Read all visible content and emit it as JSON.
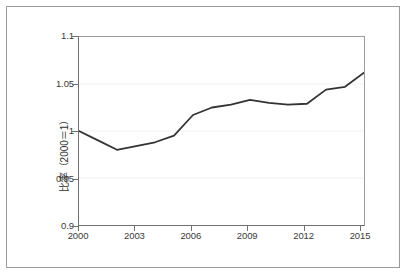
{
  "chart_data": {
    "type": "line",
    "title": "",
    "xlabel": "",
    "ylabel": "比率（2000＝1）",
    "xlim": [
      2000,
      2015
    ],
    "ylim": [
      0.9,
      1.1
    ],
    "grid": true,
    "legend": false,
    "xticks": [
      "2000",
      "2003",
      "2006",
      "2009",
      "2012",
      "2015"
    ],
    "xtick_values": [
      2000,
      2003,
      2006,
      2009,
      2012,
      2015
    ],
    "yticks": [
      "0.9",
      "0.95",
      "1",
      "1.05",
      "1.1"
    ],
    "ytick_values": [
      0.9,
      0.95,
      1.0,
      1.05,
      1.1
    ],
    "x": [
      2000,
      2001,
      2002,
      2003,
      2004,
      2005,
      2006,
      2007,
      2008,
      2009,
      2010,
      2011,
      2012,
      2013,
      2014,
      2015
    ],
    "series": [
      {
        "name": "比率（2000＝1）",
        "color": "#333333",
        "values": [
          1.0,
          0.99,
          0.98,
          0.984,
          0.988,
          0.995,
          1.017,
          1.025,
          1.028,
          1.033,
          1.03,
          1.028,
          1.029,
          1.044,
          1.047,
          1.062
        ]
      }
    ]
  },
  "axes": {
    "y_axis_label": "比率（2000＝1）",
    "x_tick_labels": [
      "2000",
      "2003",
      "2006",
      "2009",
      "2012",
      "2015"
    ],
    "y_tick_labels": [
      "0.9",
      "0.95",
      "1",
      "1.05",
      "1.1"
    ]
  },
  "colors": {
    "line": "#333333",
    "axis": "#707070",
    "grid": "#f2f2f2",
    "frame": "#9a9a9a",
    "text": "#3a3a3a",
    "background": "#ffffff"
  }
}
